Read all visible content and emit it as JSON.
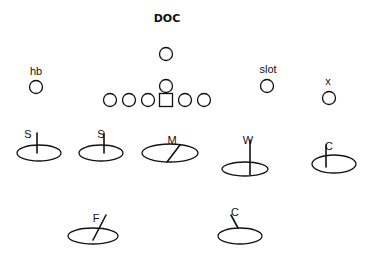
{
  "title": "DOC",
  "offense": {
    "center": {
      "shape": "square",
      "x": 166,
      "y": 100
    },
    "linemen": [
      {
        "x": 110,
        "y": 100
      },
      {
        "x": 129,
        "y": 100
      },
      {
        "x": 148,
        "y": 100
      },
      {
        "x": 185,
        "y": 100
      },
      {
        "x": 204,
        "y": 100
      }
    ],
    "qb": {
      "x": 166,
      "y": 86
    },
    "back": {
      "x": 166,
      "y": 54
    },
    "players": [
      {
        "label": "hb",
        "x": 36,
        "y": 87,
        "label_x": 36,
        "label_y": 75
      },
      {
        "label": "slot",
        "x": 267,
        "y": 86,
        "label_x": 268,
        "label_y": 73
      },
      {
        "label": "x",
        "x": 329,
        "y": 98,
        "label_x": 328,
        "label_y": 85
      }
    ]
  },
  "defense": [
    {
      "label": "S",
      "cx": 39,
      "cy": 153,
      "rx": 22,
      "ry": 8,
      "line": [
        37,
        133,
        37,
        153
      ],
      "label_x": 28,
      "label_y": 138
    },
    {
      "label": "S",
      "cx": 101,
      "cy": 153,
      "rx": 22,
      "ry": 8,
      "line": [
        104,
        133,
        104,
        153
      ],
      "label_x": 101,
      "label_y": 138
    },
    {
      "label": "M",
      "cx": 170,
      "cy": 153,
      "rx": 28,
      "ry": 9,
      "line": [
        167,
        162,
        180,
        145
      ],
      "label_x": 172,
      "label_y": 144
    },
    {
      "label": "W",
      "cx": 245,
      "cy": 169,
      "rx": 23,
      "ry": 7,
      "line": [
        250,
        140,
        250,
        175
      ],
      "label_x": 248,
      "label_y": 144
    },
    {
      "label": "C",
      "cx": 334,
      "cy": 164,
      "rx": 22,
      "ry": 9,
      "line": [
        326,
        145,
        326,
        167
      ],
      "label_x": 329,
      "label_y": 150
    },
    {
      "label": "F",
      "cx": 93,
      "cy": 236,
      "rx": 25,
      "ry": 8,
      "line": [
        93,
        240,
        106,
        215
      ],
      "label_x": 96,
      "label_y": 222
    },
    {
      "label": "C",
      "cx": 240,
      "cy": 236,
      "rx": 22,
      "ry": 8,
      "line": [
        231,
        215,
        238,
        228
      ],
      "label_x": 235,
      "label_y": 216
    }
  ]
}
